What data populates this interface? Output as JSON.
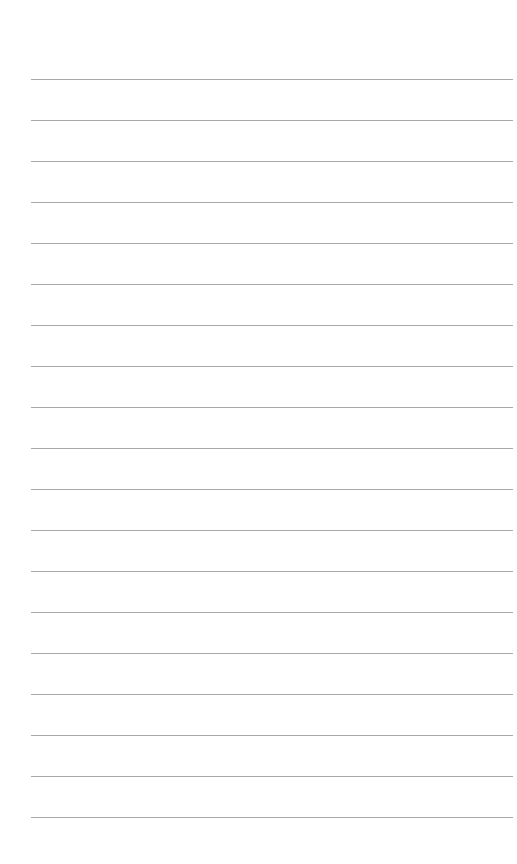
{
  "page": {
    "type": "lined-paper",
    "background": "#ffffff",
    "line_color": "#9a9a9a",
    "line_count": 19,
    "first_line_y": 79,
    "line_spacing": 41,
    "line_left": 31,
    "line_width": 482
  }
}
